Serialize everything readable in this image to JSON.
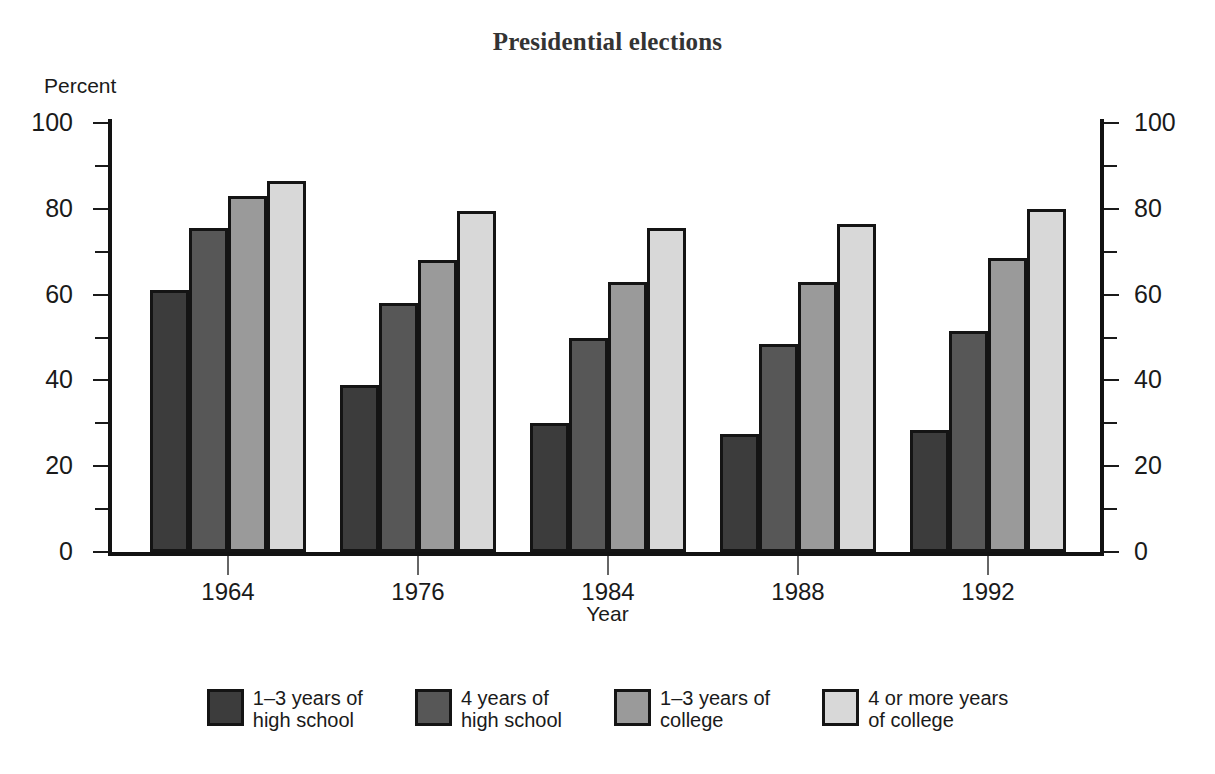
{
  "chart_data": {
    "type": "bar",
    "title": "Presidential elections",
    "xlabel": "Year",
    "ylabel": "Percent",
    "categories": [
      "1964",
      "1976",
      "1984",
      "1988",
      "1992"
    ],
    "ylim": [
      0,
      100
    ],
    "ytick_labels_left": [
      "100",
      "80",
      "60",
      "40",
      "20",
      "0"
    ],
    "ytick_labels_right": [
      "100",
      "80",
      "60",
      "40",
      "20",
      "0"
    ],
    "ytick_values": [
      100,
      80,
      60,
      40,
      20,
      0
    ],
    "minor_tick_values": [
      90,
      70,
      50,
      30,
      10
    ],
    "grid": false,
    "legend_position": "bottom",
    "series": [
      {
        "name": "1–3 years of\nhigh school",
        "color": "#3c3c3c",
        "values": [
          61,
          39,
          30,
          27.5,
          28.5
        ]
      },
      {
        "name": "4 years of\nhigh school",
        "color": "#575757",
        "values": [
          75.5,
          58,
          50,
          48.5,
          51.5
        ]
      },
      {
        "name": "1–3 years of\ncollege",
        "color": "#9a9a9a",
        "values": [
          83,
          68,
          63,
          63,
          68.5
        ]
      },
      {
        "name": "4 or more years\nof college",
        "color": "#d8d8d8",
        "values": [
          86.5,
          79.5,
          75.5,
          76.5,
          80
        ]
      }
    ]
  },
  "legend": [
    {
      "label": "1–3 years of\nhigh school",
      "color": "#3c3c3c"
    },
    {
      "label": "4 years of\nhigh school",
      "color": "#575757"
    },
    {
      "label": "1–3 years of\ncollege",
      "color": "#9a9a9a"
    },
    {
      "label": "4 or more years\nof college",
      "color": "#d8d8d8"
    }
  ],
  "style": {
    "axis_color": "#121212",
    "bar_border_color": "#141414",
    "text_color": "#1a1a1a",
    "title_color": "#333333",
    "background": "#ffffff"
  }
}
